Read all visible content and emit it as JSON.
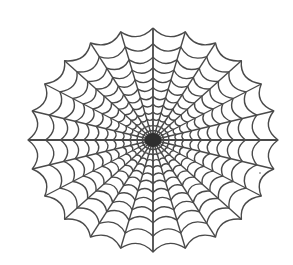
{
  "image": {
    "subject": "spider web illustration",
    "width": 293,
    "height": 265,
    "background": "#ffffff"
  },
  "web": {
    "center": {
      "x": 153,
      "y": 140
    },
    "radius_x": 125,
    "radius_y": 112,
    "spoke_count": 24,
    "ring_fractions": [
      0.05,
      0.09,
      0.135,
      0.19,
      0.25,
      0.32,
      0.39,
      0.47,
      0.555,
      0.645,
      0.74,
      0.86,
      1.0
    ],
    "stroke_color": "#4a4a4a",
    "stroke_width": 1.4,
    "hub_radius": 7,
    "hub_color": "#2e2e2e",
    "ring_sag": 0.12
  },
  "marks": [
    {
      "x": 260,
      "y": 173,
      "r": 0.8,
      "color": "#555555"
    }
  ]
}
